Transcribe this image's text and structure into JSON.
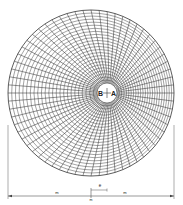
{
  "diagram": {
    "center_labels": {
      "left": "B",
      "right": "A"
    },
    "ring_count": 24,
    "radial_line_count": 64,
    "dimensions": {
      "eccentricity_label": "e",
      "left_span_label": "m",
      "right_span_label": "m",
      "center_mark_label": "m"
    },
    "colors": {
      "line": "#333333",
      "background": "#ffffff"
    }
  }
}
